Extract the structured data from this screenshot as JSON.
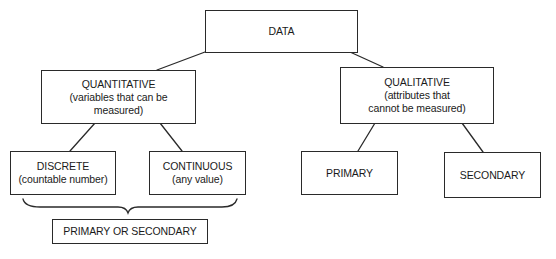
{
  "diagram": {
    "type": "hierarchy-tree",
    "root": {
      "id": "data",
      "title": "DATA"
    },
    "nodes": {
      "quantitative": {
        "title": "QUANTITATIVE",
        "sub_line1": "(variables that can be",
        "sub_line2": "measured)"
      },
      "qualitative": {
        "title": "QUALITATIVE",
        "sub_line1": "(attributes that",
        "sub_line2": "cannot be measured)"
      },
      "discrete": {
        "title": "DISCRETE",
        "sub": "(countable number)"
      },
      "continuous": {
        "title": "CONTINUOUS",
        "sub": "(any value)"
      },
      "primary": {
        "title": "PRIMARY"
      },
      "secondary": {
        "title": "SECONDARY"
      },
      "primary_or_secondary": {
        "title": "PRIMARY OR SECONDARY"
      }
    },
    "edges": [
      {
        "from": "data",
        "to": "quantitative"
      },
      {
        "from": "data",
        "to": "qualitative"
      },
      {
        "from": "quantitative",
        "to": "discrete"
      },
      {
        "from": "quantitative",
        "to": "continuous"
      },
      {
        "from": "qualitative",
        "to": "primary"
      },
      {
        "from": "qualitative",
        "to": "secondary"
      },
      {
        "from": "discrete+continuous",
        "to": "primary_or_secondary",
        "style": "brace"
      }
    ],
    "colors": {
      "stroke": "#2a2a2a",
      "text": "#1a1a1a",
      "background": "#ffffff"
    }
  }
}
